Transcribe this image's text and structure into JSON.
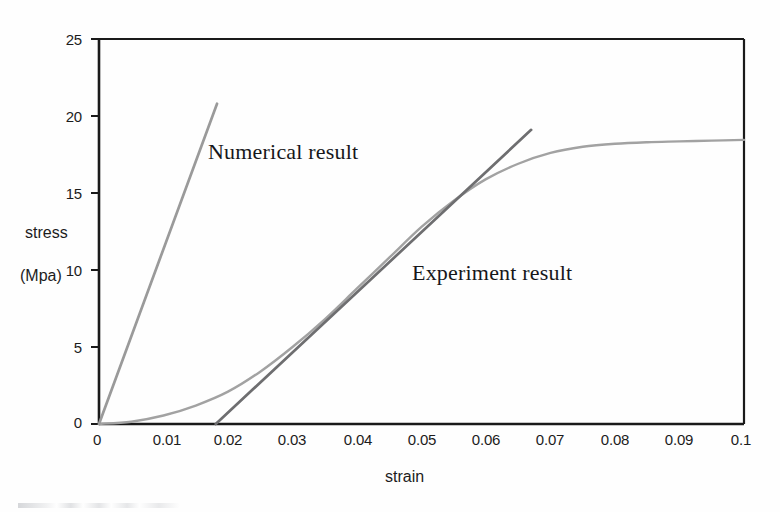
{
  "chart_data": {
    "type": "line",
    "title": "",
    "xlabel": "strain",
    "ylabel_line1": "stress",
    "ylabel_line2": "(Mpa)",
    "xlim": [
      0,
      0.1
    ],
    "ylim": [
      0,
      25
    ],
    "grid": false,
    "legend": "inline-annotations",
    "xticks": [
      0,
      0.01,
      0.02,
      0.03,
      0.04,
      0.05,
      0.06,
      0.07,
      0.08,
      0.09,
      0.1
    ],
    "xtick_labels": [
      "0",
      "0.01",
      "0.02",
      "0.03",
      "0.04",
      "0.05",
      "0.06",
      "0.07",
      "0.08",
      "0.09",
      "0.1"
    ],
    "yticks": [
      0,
      5,
      10,
      15,
      20,
      25
    ],
    "ytick_labels": [
      "0",
      "5",
      "10",
      "15",
      "20",
      "25"
    ],
    "series": [
      {
        "name": "Numerical result",
        "style": "straight-line",
        "color": "#9a9a9a",
        "x": [
          0,
          0.0183
        ],
        "values": [
          0,
          20.8
        ]
      },
      {
        "name": "Experiment result (linear fit)",
        "style": "straight-line",
        "color": "#6e6e70",
        "x": [
          0.0181,
          0.067
        ],
        "values": [
          0,
          19.1
        ]
      },
      {
        "name": "Experiment result (curve)",
        "style": "curve",
        "color": "#a2a2a2",
        "x": [
          0,
          0.005,
          0.01,
          0.015,
          0.02,
          0.025,
          0.03,
          0.035,
          0.04,
          0.045,
          0.05,
          0.055,
          0.06,
          0.065,
          0.07,
          0.075,
          0.08,
          0.085,
          0.09,
          0.095,
          0.1
        ],
        "values": [
          0.0,
          0.15,
          0.55,
          1.2,
          2.1,
          3.4,
          5.0,
          6.8,
          8.8,
          10.8,
          12.8,
          14.5,
          15.9,
          16.9,
          17.6,
          18.0,
          18.2,
          18.3,
          18.35,
          18.4,
          18.45
        ]
      }
    ],
    "annotations": [
      {
        "text": "Numerical result",
        "x_px": 208,
        "y_px": 155
      },
      {
        "text": "Experiment result",
        "x_px": 412,
        "y_px": 276
      }
    ]
  },
  "axes": {
    "x_axis_title": "strain",
    "y_axis_title_line1": "stress",
    "y_axis_title_line2": "(Mpa)"
  },
  "ticks": {
    "y": [
      {
        "label": "25"
      },
      {
        "label": "20"
      },
      {
        "label": "15"
      },
      {
        "label": "10"
      },
      {
        "label": "5"
      },
      {
        "label": "0"
      }
    ],
    "x": [
      {
        "label": "0"
      },
      {
        "label": "0.01"
      },
      {
        "label": "0.02"
      },
      {
        "label": "0.03"
      },
      {
        "label": "0.04"
      },
      {
        "label": "0.05"
      },
      {
        "label": "0.06"
      },
      {
        "label": "0.07"
      },
      {
        "label": "0.08"
      },
      {
        "label": "0.09"
      },
      {
        "label": "0.1"
      }
    ]
  },
  "labels": {
    "numerical": "Numerical result",
    "experiment": "Experiment result"
  },
  "colors": {
    "axis": "#1a1a1a",
    "numerical_line": "#9a9a9a",
    "experiment_line": "#6e6e70",
    "experiment_curve": "#a2a2a2",
    "text": "#1c1c1c",
    "background": "#fefefe"
  }
}
